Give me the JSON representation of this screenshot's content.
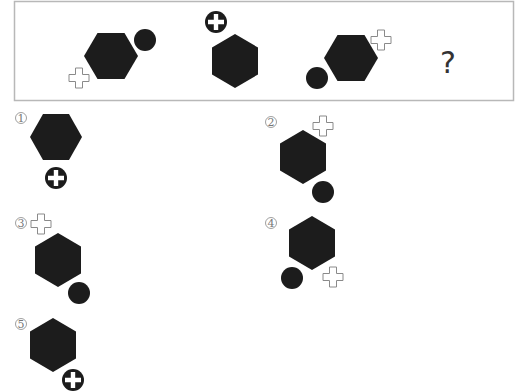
{
  "puzzle": {
    "question_mark": "?",
    "sequence": [
      {
        "hexagon": "flat-top",
        "circle": "upper-right",
        "plus": "outline lower-left"
      },
      {
        "hexagon": "pointy-top",
        "circle_with_plus": "top-left"
      },
      {
        "hexagon": "flat-top",
        "circle": "lower-left",
        "plus": "outline upper-right"
      }
    ]
  },
  "options": [
    {
      "label": "1",
      "hexagon": "flat-top",
      "circle_with_plus": "below"
    },
    {
      "label": "2",
      "hexagon": "pointy-top",
      "plus": "outline upper-right",
      "circle": "lower-right"
    },
    {
      "label": "3",
      "hexagon": "pointy-top",
      "plus": "outline upper-left",
      "circle": "lower-right"
    },
    {
      "label": "4",
      "hexagon": "pointy-top",
      "circle": "lower-left",
      "plus": "outline lower-right"
    },
    {
      "label": "5",
      "hexagon": "pointy-top",
      "circle_with_plus": "lower-right"
    }
  ],
  "colors": {
    "shape": "#1c1c1c",
    "frame": "#b8b8b8",
    "outline": "#8a8a8a"
  }
}
